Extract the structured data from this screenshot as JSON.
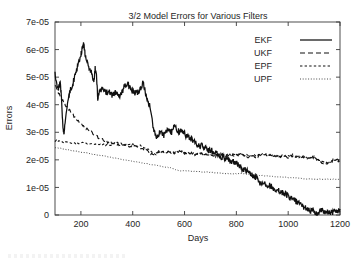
{
  "chart_data": {
    "type": "line",
    "title": "3/2 Model Errors for Various Filters",
    "xlabel": "Days",
    "ylabel": "Errors",
    "xlim": [
      100,
      1200
    ],
    "ylim": [
      0,
      7e-05
    ],
    "grid": false,
    "legend_position": "top-right",
    "xticks": [
      200,
      400,
      600,
      800,
      1000,
      1200
    ],
    "xtick_labels": [
      "200",
      "400",
      "600",
      "800",
      "1000",
      "1200"
    ],
    "yticks": [
      0,
      1e-05,
      2e-05,
      3e-05,
      4e-05,
      5e-05,
      6e-05,
      7e-05
    ],
    "ytick_labels": [
      "0",
      "1e-05",
      "2e-05",
      "3e-05",
      "4e-05",
      "5e-05",
      "6e-05",
      "7e-05"
    ],
    "series": [
      {
        "name": "EKF",
        "style": "solid",
        "x": [
          100,
          110,
          120,
          125,
          130,
          135,
          140,
          150,
          160,
          170,
          180,
          190,
          200,
          205,
          210,
          215,
          220,
          230,
          240,
          250,
          255,
          260,
          265,
          270,
          280,
          290,
          300,
          310,
          320,
          330,
          340,
          350,
          360,
          370,
          380,
          390,
          400,
          410,
          420,
          430,
          440,
          450,
          460,
          470,
          480,
          490,
          500,
          510,
          520,
          530,
          540,
          550,
          560,
          570,
          580,
          590,
          600,
          610,
          620,
          630,
          640,
          650,
          660,
          670,
          680,
          690,
          700,
          710,
          720,
          730,
          740,
          750,
          760,
          770,
          780,
          790,
          800,
          810,
          820,
          830,
          840,
          850,
          860,
          870,
          880,
          890,
          900,
          910,
          920,
          930,
          940,
          950,
          960,
          970,
          980,
          990,
          1000,
          1010,
          1020,
          1030,
          1040,
          1050,
          1060,
          1070,
          1080,
          1090,
          1100,
          1110,
          1120,
          1130,
          1140,
          1150,
          1160,
          1170,
          1180,
          1190,
          1200
        ],
        "y": [
          5.2e-05,
          4.55e-05,
          4.75e-05,
          4.3e-05,
          3.3e-05,
          2.9e-05,
          3.5e-05,
          4.2e-05,
          4.55e-05,
          4.8e-05,
          5.15e-05,
          5.45e-05,
          5.8e-05,
          6.05e-05,
          6.2e-05,
          5.95e-05,
          5.6e-05,
          5.35e-05,
          5.2e-05,
          4.85e-05,
          5.3e-05,
          5.1e-05,
          4.2e-05,
          4.45e-05,
          4.55e-05,
          4.5e-05,
          4.45e-05,
          4.5e-05,
          4.35e-05,
          4.45e-05,
          4.4e-05,
          4.35e-05,
          4.5e-05,
          4.7e-05,
          4.75e-05,
          4.6e-05,
          4.5e-05,
          4.4e-05,
          4.45e-05,
          4.6e-05,
          4.8e-05,
          4.4e-05,
          4.1e-05,
          3.85e-05,
          3.1e-05,
          2.85e-05,
          2.95e-05,
          3e-05,
          2.9e-05,
          3.05e-05,
          3.1e-05,
          3e-05,
          3.2e-05,
          3.1e-05,
          3e-05,
          3.05e-05,
          2.95e-05,
          2.85e-05,
          2.8e-05,
          2.75e-05,
          2.6e-05,
          2.55e-05,
          2.5e-05,
          2.5e-05,
          2.45e-05,
          2.4e-05,
          2.35e-05,
          2.3e-05,
          2.25e-05,
          2.2e-05,
          2.1e-05,
          2.1e-05,
          2.05e-05,
          2e-05,
          1.95e-05,
          1.95e-05,
          1.9e-05,
          1.8e-05,
          1.7e-05,
          1.65e-05,
          1.6e-05,
          1.5e-05,
          1.45e-05,
          1.4e-05,
          1.35e-05,
          1.2e-05,
          1.15e-05,
          1.15e-05,
          1.1e-05,
          1.05e-05,
          1e-05,
          9.5e-06,
          9e-06,
          8.5e-06,
          8e-06,
          7.5e-06,
          7e-06,
          6e-06,
          5.5e-06,
          5e-06,
          4e-06,
          3.5e-06,
          3e-06,
          2.5e-06,
          2e-06,
          1.5e-06,
          1e-06,
          2e-07,
          1.2e-06,
          1.6e-06,
          7e-07,
          9e-07,
          1.1e-06,
          1.1e-06,
          1.2e-06,
          1.5e-06,
          2.2e-06
        ]
      },
      {
        "name": "UKF",
        "style": "dashed",
        "x": [
          100,
          120,
          140,
          160,
          180,
          200,
          220,
          240,
          260,
          280,
          300,
          320,
          340,
          360,
          380,
          400,
          420,
          440,
          460,
          480,
          500,
          520,
          540,
          560,
          580,
          600,
          620,
          640,
          660,
          680,
          700,
          720,
          740,
          760,
          780,
          800,
          820,
          840,
          860,
          880,
          900,
          920,
          940,
          960,
          980,
          1000,
          1020,
          1040,
          1060,
          1080,
          1100,
          1120,
          1140,
          1160,
          1180,
          1200
        ],
        "y": [
          4.7e-05,
          4.3e-05,
          4e-05,
          3.75e-05,
          3.5e-05,
          3.3e-05,
          3.15e-05,
          3e-05,
          2.85e-05,
          2.75e-05,
          2.65e-05,
          2.6e-05,
          2.55e-05,
          2.55e-05,
          2.5e-05,
          2.5e-05,
          2.45e-05,
          2.4e-05,
          2.3e-05,
          2.15e-05,
          2.35e-05,
          2.25e-05,
          2.3e-05,
          2.25e-05,
          2.3e-05,
          2.25e-05,
          2.25e-05,
          2.2e-05,
          2.25e-05,
          2.2e-05,
          2.2e-05,
          2.15e-05,
          2.2e-05,
          2.15e-05,
          2.2e-05,
          2.15e-05,
          2.2e-05,
          2.1e-05,
          2.15e-05,
          2.1e-05,
          2.2e-05,
          2.15e-05,
          2.2e-05,
          2.1e-05,
          2.15e-05,
          2.1e-05,
          2.2e-05,
          2.1e-05,
          2.1e-05,
          2.05e-05,
          2.1e-05,
          1.95e-05,
          1.85e-05,
          1.9e-05,
          2.05e-05,
          1.95e-05
        ]
      },
      {
        "name": "EPF",
        "style": "dotted-dash",
        "x": [
          100,
          130,
          160,
          190,
          220,
          250,
          280,
          310,
          340,
          370,
          400,
          430,
          460,
          490,
          520,
          550,
          580,
          610,
          640,
          670,
          700,
          730,
          760,
          790,
          820,
          850,
          880,
          910,
          940,
          970,
          1000,
          1030,
          1060,
          1090,
          1120,
          1150,
          1180,
          1200
        ],
        "y": [
          2.7e-05,
          2.65e-05,
          2.6e-05,
          2.6e-05,
          2.6e-05,
          2.55e-05,
          2.55e-05,
          2.55e-05,
          2.6e-05,
          2.55e-05,
          2.55e-05,
          2.5e-05,
          2.4e-05,
          2.2e-05,
          2.3e-05,
          2.25e-05,
          2.3e-05,
          2.25e-05,
          2.25e-05,
          2.2e-05,
          2.25e-05,
          2.2e-05,
          2.2e-05,
          2.15e-05,
          2.2e-05,
          2.15e-05,
          2.15e-05,
          2.2e-05,
          2.15e-05,
          2.1e-05,
          2.15e-05,
          2.1e-05,
          2.1e-05,
          2.1e-05,
          2e-05,
          1.9e-05,
          2e-05,
          1.95e-05
        ]
      },
      {
        "name": "UPF",
        "style": "fine-dotted",
        "x": [
          100,
          130,
          160,
          190,
          220,
          250,
          280,
          310,
          340,
          370,
          400,
          430,
          460,
          490,
          520,
          550,
          580,
          610,
          640,
          670,
          700,
          730,
          760,
          790,
          820,
          850,
          880,
          910,
          940,
          970,
          1000,
          1030,
          1060,
          1090,
          1120,
          1150,
          1180,
          1200
        ],
        "y": [
          2.45e-05,
          2.4e-05,
          2.35e-05,
          2.3e-05,
          2.25e-05,
          2.2e-05,
          2.15e-05,
          2.1e-05,
          2.05e-05,
          2e-05,
          1.95e-05,
          1.9e-05,
          1.85e-05,
          1.8e-05,
          1.75e-05,
          1.7e-05,
          1.6e-05,
          1.6e-05,
          1.58e-05,
          1.56e-05,
          1.55e-05,
          1.52e-05,
          1.5e-05,
          1.5e-05,
          1.5e-05,
          1.48e-05,
          1.45e-05,
          1.42e-05,
          1.4e-05,
          1.38e-05,
          1.36e-05,
          1.34e-05,
          1.32e-05,
          1.3e-05,
          1.3e-05,
          1.3e-05,
          1.3e-05,
          1.3e-05
        ]
      }
    ]
  },
  "legend": {
    "items": [
      {
        "label": "EKF"
      },
      {
        "label": "UKF"
      },
      {
        "label": "EPF"
      },
      {
        "label": "UPF"
      }
    ]
  }
}
